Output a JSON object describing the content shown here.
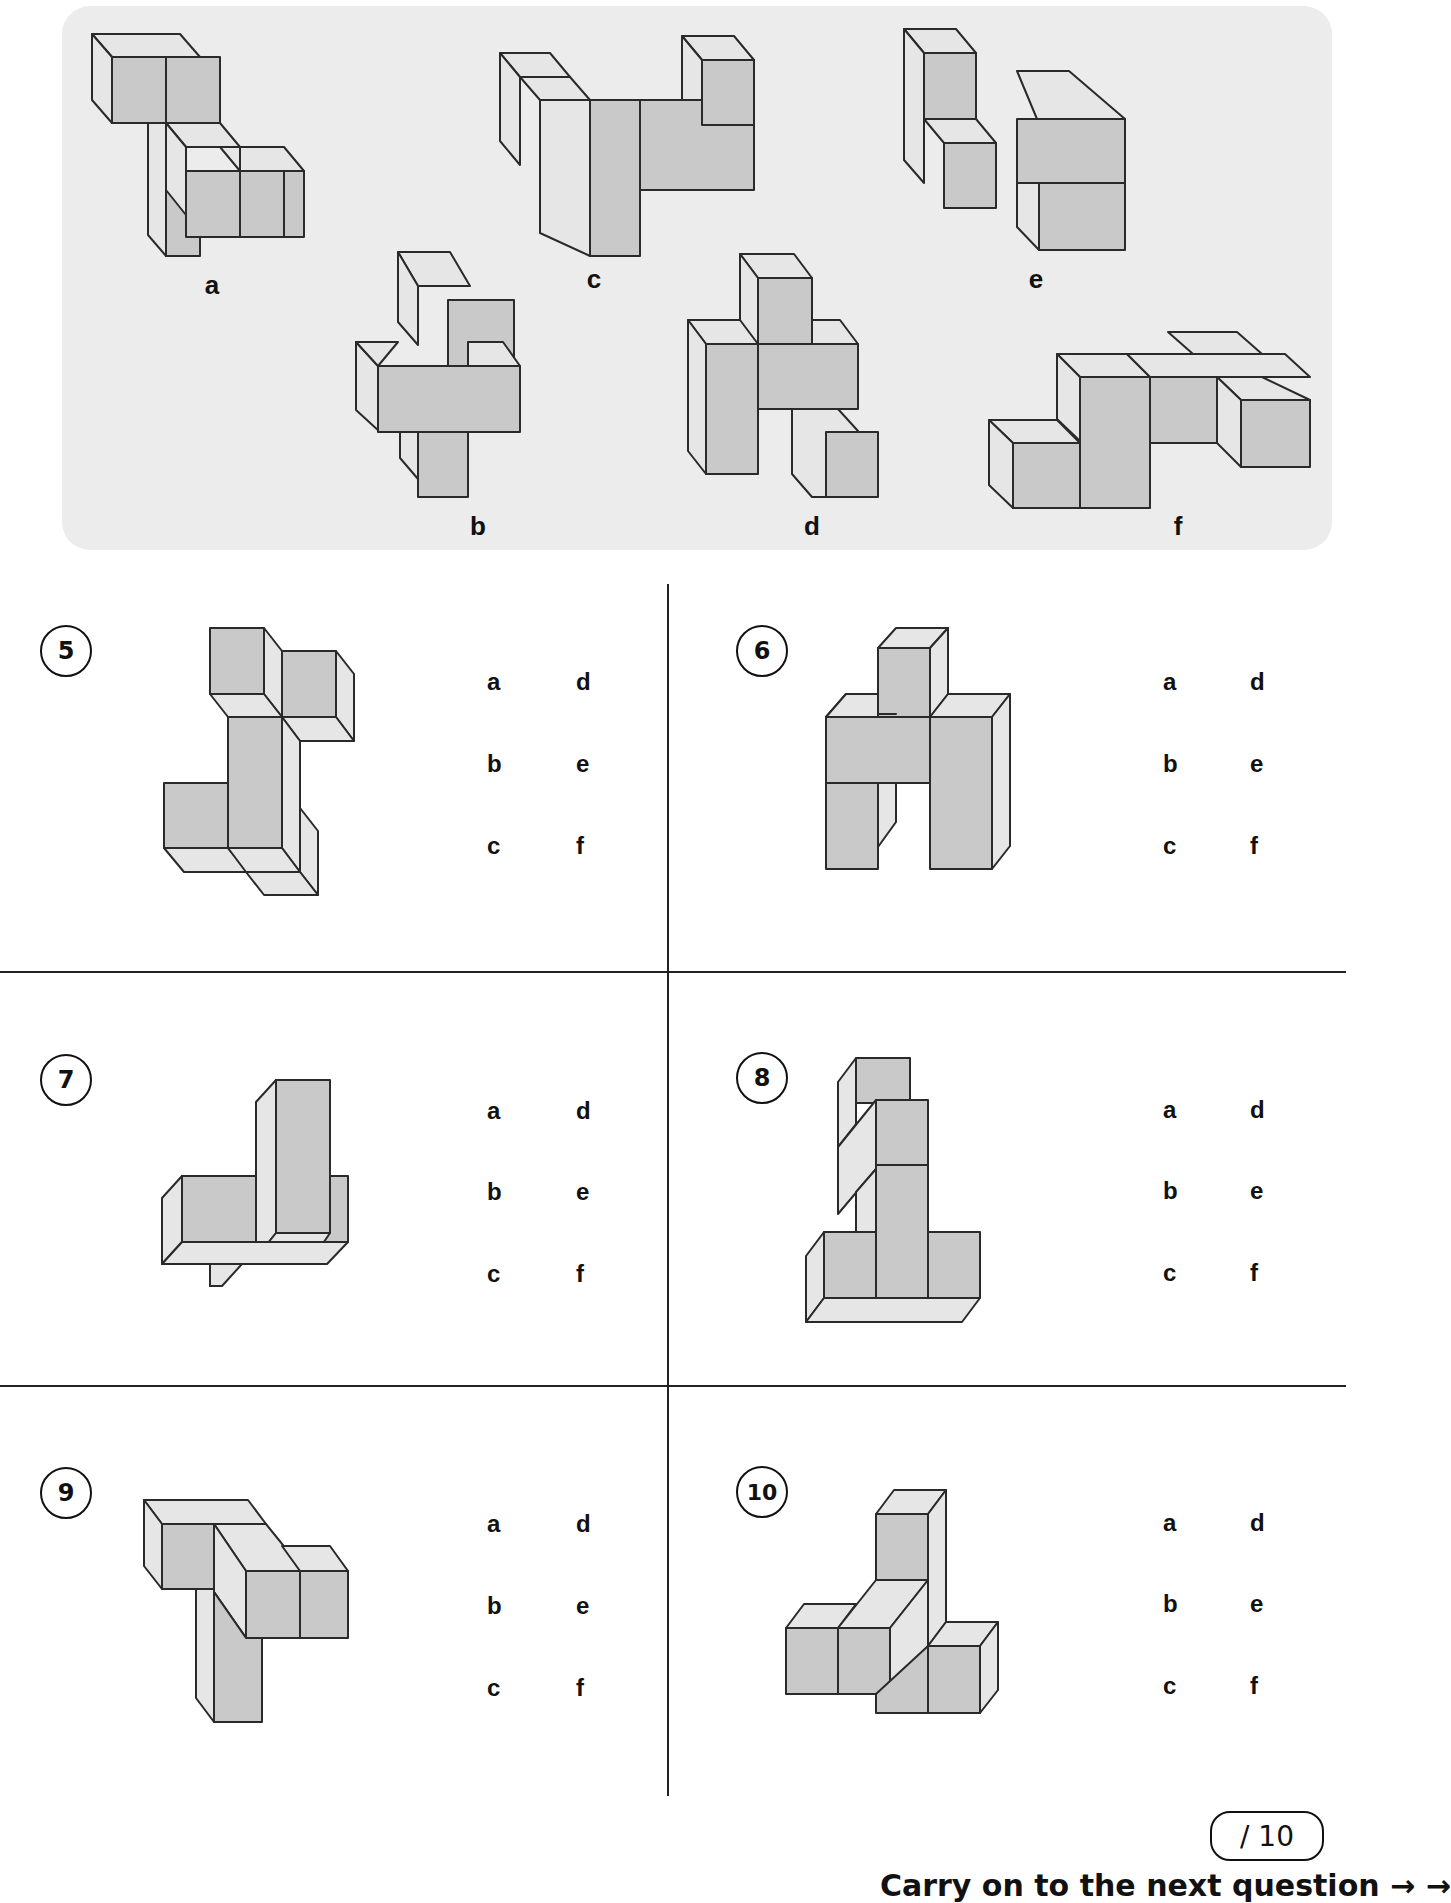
{
  "options_panel": {
    "labels": {
      "a": "a",
      "b": "b",
      "c": "c",
      "d": "d",
      "e": "e",
      "f": "f"
    }
  },
  "questions": [
    {
      "number": "5",
      "choices": [
        "a",
        "d",
        "b",
        "e",
        "c",
        "f"
      ]
    },
    {
      "number": "6",
      "choices": [
        "a",
        "d",
        "b",
        "e",
        "c",
        "f"
      ]
    },
    {
      "number": "7",
      "choices": [
        "a",
        "d",
        "b",
        "e",
        "c",
        "f"
      ]
    },
    {
      "number": "8",
      "choices": [
        "a",
        "d",
        "b",
        "e",
        "c",
        "f"
      ]
    },
    {
      "number": "9",
      "choices": [
        "a",
        "d",
        "b",
        "e",
        "c",
        "f"
      ]
    },
    {
      "number": "10",
      "choices": [
        "a",
        "d",
        "b",
        "e",
        "c",
        "f"
      ]
    }
  ],
  "score": {
    "text": "/ 10"
  },
  "footer": {
    "text": "Carry on to the next question → →"
  },
  "colors": {
    "panel_bg": "#ececec",
    "cube_front": "#c9c9c9",
    "cube_side": "#e6e6e6",
    "outline": "#2a2a2a"
  }
}
